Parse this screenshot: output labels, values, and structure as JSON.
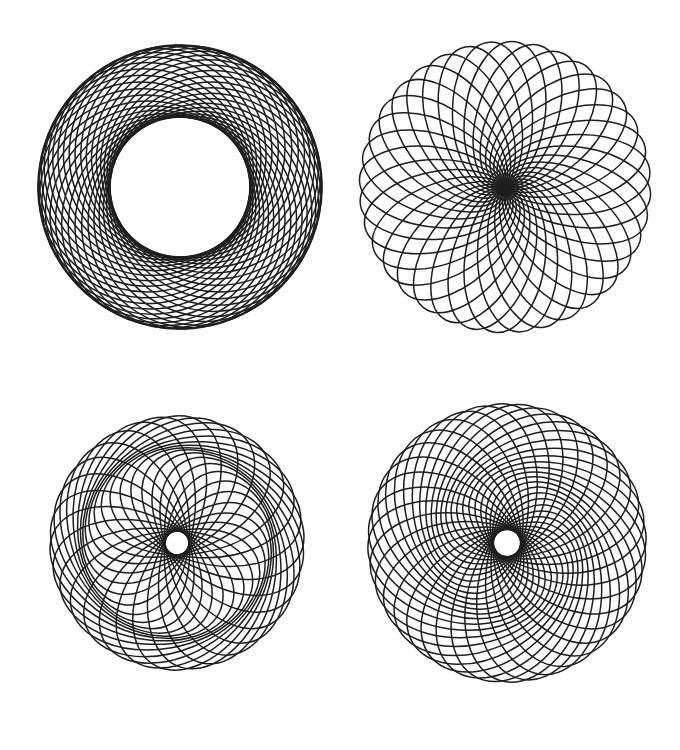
{
  "page": {
    "width": 680,
    "height": 750,
    "background": "#ffffff"
  },
  "style": {
    "stroke_color": "#1e1e1e",
    "stroke_width": 1.5
  },
  "figures": [
    {
      "name": "spirograph-top-left",
      "description": "ring of offset circles with large hollow center",
      "center": [
        180,
        187
      ],
      "copies": 36,
      "semi_major": 107,
      "semi_minor": 104,
      "offset": 36,
      "tilt_deg": 35,
      "rotation_deg": 0
    },
    {
      "name": "spirograph-top-right",
      "description": "rosette of ellipses converging on dark center",
      "center": [
        505,
        187
      ],
      "copies": 36,
      "semi_major": 74,
      "semi_minor": 40,
      "offset": 72,
      "tilt_deg": 8,
      "rotation_deg": 0
    },
    {
      "name": "spirograph-bottom-left",
      "description": "swirling ring of tilted ellipses around medium hollow center",
      "center": [
        177,
        543
      ],
      "copies": 30,
      "semi_major": 92,
      "semi_minor": 58,
      "offset": 50,
      "tilt_deg": 62,
      "rotation_deg": 0
    },
    {
      "name": "spirograph-bottom-right",
      "description": "ellipses with small hollow center and dark envelope ring",
      "center": [
        507,
        543
      ],
      "copies": 36,
      "semi_major": 88,
      "semi_minor": 58,
      "offset": 57,
      "tilt_deg": 38,
      "rotation_deg": 0
    }
  ]
}
